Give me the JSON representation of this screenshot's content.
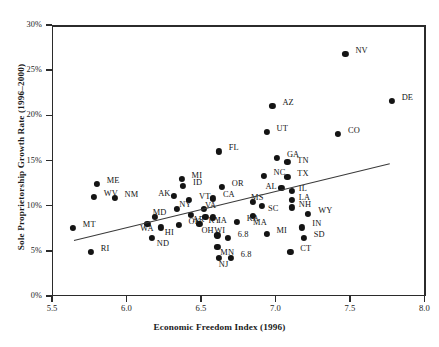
{
  "chart_data": {
    "type": "scatter",
    "title": "",
    "xlabel": "Economic Freedom Index (1996)",
    "ylabel": "Sole Proprietorship Growth Rate (1996–2000)",
    "xlim": [
      5.5,
      8.0
    ],
    "ylim": [
      0,
      30
    ],
    "xticks": [
      "5.5",
      "6.0",
      "6.5",
      "7.0",
      "7.5",
      "8.0"
    ],
    "xtick_values": [
      5.5,
      6.0,
      6.5,
      7.0,
      7.5,
      8.0
    ],
    "yticks": [
      "0%",
      "5%",
      "10%",
      "15%",
      "20%",
      "25%",
      "30%"
    ],
    "ytick_values": [
      0,
      5,
      10,
      15,
      20,
      25,
      30
    ],
    "grid": false,
    "legend": null,
    "trendline": {
      "x0": 5.65,
      "y0": 6.2,
      "x1": 7.77,
      "y1": 14.7
    },
    "points": [
      {
        "label": "MT",
        "x": 5.64,
        "y": 7.5,
        "lx": 10,
        "ly": -4
      },
      {
        "label": "RI",
        "x": 5.76,
        "y": 4.9,
        "lx": 10,
        "ly": -4
      },
      {
        "label": "ME",
        "x": 5.8,
        "y": 12.4,
        "lx": 10,
        "ly": -4
      },
      {
        "label": "WV",
        "x": 5.78,
        "y": 11.0,
        "lx": 10,
        "ly": -4
      },
      {
        "label": "NM",
        "x": 5.92,
        "y": 10.9,
        "lx": 10,
        "ly": -4
      },
      {
        "label": "WA",
        "x": 6.14,
        "y": 8.0,
        "lx": -7,
        "ly": 4
      },
      {
        "label": "ND",
        "x": 6.17,
        "y": 6.4,
        "lx": 5,
        "ly": 5
      },
      {
        "label": "HI",
        "x": 6.23,
        "y": 7.6,
        "lx": 4,
        "ly": 5
      },
      {
        "label": "MD",
        "x": 6.19,
        "y": 8.8,
        "lx": -2,
        "ly": -5
      },
      {
        "label": "AK",
        "x": 6.32,
        "y": 11.1,
        "lx": -16,
        "ly": -3
      },
      {
        "label": "NY",
        "x": 6.34,
        "y": 9.6,
        "lx": 2,
        "ly": -5
      },
      {
        "label": "OK",
        "x": 6.35,
        "y": 7.9,
        "lx": 10,
        "ly": -4
      },
      {
        "label": "MI",
        "x": 6.37,
        "y": 13.0,
        "lx": 10,
        "ly": -4
      },
      {
        "label": "ID",
        "x": 6.38,
        "y": 12.2,
        "lx": 10,
        "ly": -4
      },
      {
        "label": "VT",
        "x": 6.42,
        "y": 10.6,
        "lx": 10,
        "ly": -4
      },
      {
        "label": "AR",
        "x": 6.43,
        "y": 9.0,
        "lx": 2,
        "ly": 4
      },
      {
        "label": "OH",
        "x": 6.49,
        "y": 8.0,
        "lx": 2,
        "ly": 6
      },
      {
        "label": "VA",
        "x": 6.52,
        "y": 9.6,
        "lx": 1,
        "ly": -4
      },
      {
        "label": "KY",
        "x": 6.53,
        "y": 8.8,
        "lx": 3,
        "ly": 3
      },
      {
        "label": "IA",
        "x": 6.58,
        "y": 8.7,
        "lx": 5,
        "ly": 3
      },
      {
        "label": "CA",
        "x": 6.58,
        "y": 10.8,
        "lx": 10,
        "ly": -4
      },
      {
        "label": "OR",
        "x": 6.64,
        "y": 12.1,
        "lx": 10,
        "ly": -4
      },
      {
        "label": "FL",
        "x": 6.62,
        "y": 16.0,
        "lx": 10,
        "ly": -4
      },
      {
        "label": "WI",
        "x": 6.61,
        "y": 6.7,
        "lx": -3,
        "ly": -5
      },
      {
        "label": "6.8",
        "x": 6.68,
        "y": 6.4,
        "lx": 10,
        "ly": -4
      },
      {
        "label": "MN",
        "x": 6.61,
        "y": 5.4,
        "lx": 3,
        "ly": 5
      },
      {
        "label": "NJ",
        "x": 6.62,
        "y": 4.2,
        "lx": 0,
        "ly": 6
      },
      {
        "label": "6.8",
        "x": 6.7,
        "y": 4.2,
        "lx": 10,
        "ly": -4
      },
      {
        "label": "KA",
        "x": 6.74,
        "y": 8.2,
        "lx": 10,
        "ly": -4
      },
      {
        "label": "MS",
        "x": 6.85,
        "y": 10.4,
        "lx": -2,
        "ly": -5
      },
      {
        "label": "SC",
        "x": 6.91,
        "y": 10.0,
        "lx": 6,
        "ly": 2
      },
      {
        "label": "MA",
        "x": 6.85,
        "y": 8.9,
        "lx": 0,
        "ly": 6
      },
      {
        "label": "MI",
        "x": 6.94,
        "y": 6.9,
        "lx": 10,
        "ly": -4
      },
      {
        "label": "NC",
        "x": 6.92,
        "y": 13.3,
        "lx": 10,
        "ly": -4
      },
      {
        "label": "UT",
        "x": 6.94,
        "y": 18.2,
        "lx": 10,
        "ly": -4
      },
      {
        "label": "AZ",
        "x": 6.98,
        "y": 21.0,
        "lx": 10,
        "ly": -4
      },
      {
        "label": "GA",
        "x": 7.01,
        "y": 15.3,
        "lx": 10,
        "ly": -4
      },
      {
        "label": "TN",
        "x": 7.08,
        "y": 14.8,
        "lx": 10,
        "ly": -2
      },
      {
        "label": "CT",
        "x": 7.1,
        "y": 4.9,
        "lx": 10,
        "ly": -4
      },
      {
        "label": "TX",
        "x": 7.08,
        "y": 13.2,
        "lx": 10,
        "ly": -4
      },
      {
        "label": "AL",
        "x": 7.04,
        "y": 12.0,
        "lx": -16,
        "ly": -2
      },
      {
        "label": "IL",
        "x": 7.11,
        "y": 11.6,
        "lx": 7,
        "ly": -3
      },
      {
        "label": "LA",
        "x": 7.11,
        "y": 10.6,
        "lx": 7,
        "ly": -3
      },
      {
        "label": "NH",
        "x": 7.11,
        "y": 9.8,
        "lx": 7,
        "ly": -3
      },
      {
        "label": "IN",
        "x": 7.18,
        "y": 7.6,
        "lx": 10,
        "ly": -4
      },
      {
        "label": "SD",
        "x": 7.19,
        "y": 6.4,
        "lx": 10,
        "ly": -4
      },
      {
        "label": "WY",
        "x": 7.22,
        "y": 9.1,
        "lx": 10,
        "ly": -4
      },
      {
        "label": "CO",
        "x": 7.42,
        "y": 17.9,
        "lx": 10,
        "ly": -4
      },
      {
        "label": "NV",
        "x": 7.47,
        "y": 26.8,
        "lx": 10,
        "ly": -4
      },
      {
        "label": "DE",
        "x": 7.78,
        "y": 21.6,
        "lx": 10,
        "ly": -4
      }
    ]
  }
}
